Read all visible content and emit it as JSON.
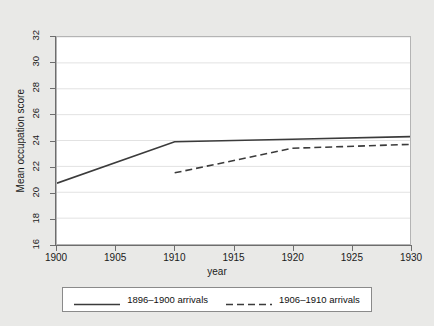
{
  "chart_data": {
    "type": "line",
    "title": "",
    "xlabel": "year",
    "ylabel": "Mean occupation score",
    "xlim": [
      1900,
      1930
    ],
    "ylim": [
      16,
      32
    ],
    "xticks": [
      1900,
      1905,
      1910,
      1915,
      1920,
      1925,
      1930
    ],
    "yticks": [
      16,
      18,
      20,
      22,
      24,
      26,
      28,
      30,
      32
    ],
    "grid": "horizontal",
    "legend_position": "below",
    "series": [
      {
        "name": "1896–1900 arrivals",
        "style": "solid",
        "color": "#3b3b3b",
        "x": [
          1900,
          1910,
          1920,
          1930
        ],
        "values": [
          20.7,
          23.9,
          24.1,
          24.3
        ]
      },
      {
        "name": "1906–1910 arrivals",
        "style": "dashed",
        "color": "#3b3b3b",
        "x": [
          1910,
          1920,
          1930
        ],
        "values": [
          21.5,
          23.4,
          23.7
        ]
      }
    ]
  },
  "axes": {
    "x_tick_labels": [
      "1900",
      "1905",
      "1910",
      "1915",
      "1920",
      "1925",
      "1930"
    ],
    "y_tick_labels": [
      "16",
      "18",
      "20",
      "22",
      "24",
      "26",
      "28",
      "30",
      "32"
    ],
    "x_title": "year",
    "y_title": "Mean occupation score"
  },
  "legend": {
    "entries": [
      {
        "label": "1896–1900 arrivals",
        "style": "solid"
      },
      {
        "label": "1906–1910 arrivals",
        "style": "dashed"
      }
    ]
  },
  "colors": {
    "figure_background": "#e9e9e7",
    "plot_background": "#ffffff",
    "line": "#3b3b3b",
    "grid": "#e2e2e2",
    "axis": "#6d6d6d",
    "text": "#1a1a1a"
  }
}
